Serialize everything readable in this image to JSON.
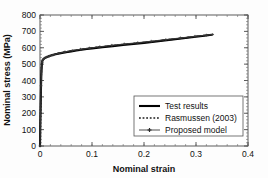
{
  "figure": {
    "background": "#ffffff",
    "plot_area": {
      "left": 40,
      "top": 15,
      "right": 248,
      "bottom": 146
    },
    "axis_color": "#4a4a4a"
  },
  "chart_data": {
    "type": "line",
    "title": "",
    "xlabel": "Nominal strain",
    "ylabel": "Nominal stress (MPa)",
    "xlim": [
      0,
      0.4
    ],
    "ylim": [
      0,
      800
    ],
    "xticks": [
      0,
      0.1,
      0.2,
      0.3,
      0.4
    ],
    "xticklabels": [
      "0",
      "0.1",
      "0.2",
      "0.3",
      "0.4"
    ],
    "yticks": [
      0,
      100,
      200,
      300,
      400,
      500,
      600,
      700,
      800
    ],
    "yticklabels": [
      "0",
      "100",
      "200",
      "300",
      "400",
      "500",
      "600",
      "700",
      "800"
    ],
    "minor_ticks": true,
    "grid": false,
    "legend_position": "lower right",
    "series": [
      {
        "name": "Test results",
        "style": "solid",
        "color": "#000000",
        "linewidth": 2.1,
        "marker": "none",
        "x": [
          0,
          0.0005,
          0.001,
          0.0015,
          0.002,
          0.0025,
          0.003,
          0.0035,
          0.004,
          0.0045,
          0.005,
          0.006,
          0.007,
          0.008,
          0.009,
          0.01,
          0.012,
          0.014,
          0.017,
          0.02,
          0.025,
          0.03,
          0.04,
          0.05,
          0.06,
          0.07,
          0.08,
          0.09,
          0.1,
          0.12,
          0.14,
          0.16,
          0.18,
          0.2,
          0.22,
          0.24,
          0.26,
          0.28,
          0.3,
          0.32,
          0.33
        ],
        "y": [
          0,
          100,
          200,
          290,
          370,
          430,
          470,
          495,
          510,
          518,
          523,
          528,
          531,
          534,
          536,
          538,
          541,
          544,
          548,
          551,
          556,
          560,
          567,
          573,
          578,
          583,
          588,
          592,
          596,
          603,
          610,
          617,
          623,
          630,
          637,
          645,
          652,
          660,
          667,
          675,
          679
        ]
      },
      {
        "name": "Rasmussen (2003)",
        "style": "dotted",
        "color": "#1b1b1b",
        "linewidth": 1.5,
        "marker": "none",
        "x": [
          0,
          0.001,
          0.002,
          0.003,
          0.004,
          0.005,
          0.007,
          0.01,
          0.015,
          0.02,
          0.03,
          0.04,
          0.06,
          0.08,
          0.1,
          0.13,
          0.16,
          0.19,
          0.22,
          0.25,
          0.28,
          0.31,
          0.33
        ],
        "y": [
          0,
          200,
          372,
          472,
          512,
          526,
          533,
          540,
          547,
          553,
          562,
          569,
          581,
          590,
          599,
          610,
          620,
          629,
          639,
          650,
          661,
          673,
          680
        ]
      },
      {
        "name": "Proposed model",
        "style": "solid-marker",
        "color": "#3a3a3a",
        "linewidth": 0.9,
        "marker": "plus",
        "x": [
          0,
          0.002,
          0.004,
          0.006,
          0.009,
          0.013,
          0.018,
          0.025,
          0.035,
          0.048,
          0.062,
          0.078,
          0.095,
          0.115,
          0.138,
          0.162,
          0.188,
          0.214,
          0.242,
          0.27,
          0.298,
          0.32,
          0.332
        ],
        "y": [
          0,
          368,
          510,
          528,
          537,
          543,
          549,
          556,
          565,
          575,
          583,
          591,
          598,
          606,
          615,
          623,
          631,
          640,
          650,
          660,
          670,
          677,
          681
        ]
      }
    ]
  },
  "legend": {
    "entries": [
      {
        "label": "Test results",
        "marker": "solid-thick-line"
      },
      {
        "label": "Rasmussen (2003)",
        "marker": "dotted-line"
      },
      {
        "label": "Proposed model",
        "marker": "line-with-plus-markers"
      }
    ],
    "box": {
      "x": 134,
      "y": 96,
      "width": 109,
      "height": 40
    },
    "border_color": "#555555",
    "background": "#ffffff"
  }
}
